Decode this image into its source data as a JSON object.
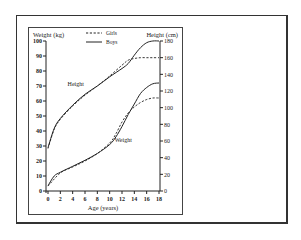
{
  "chart_data": {
    "type": "line",
    "title": "",
    "xlabel": "Age (years)",
    "ylabel": "Weight (kg)",
    "ylabel_right": "Height (cm)",
    "xlim": [
      0,
      18
    ],
    "ylim": [
      0,
      100
    ],
    "ylim_right": [
      0,
      180
    ],
    "x_ticks": [
      0,
      2,
      4,
      6,
      8,
      10,
      12,
      14,
      16,
      18
    ],
    "y_ticks": [
      0,
      10,
      20,
      30,
      40,
      50,
      60,
      70,
      80,
      90,
      100
    ],
    "y_ticks_right": [
      0,
      20,
      40,
      60,
      80,
      100,
      120,
      140,
      160,
      180
    ],
    "grid": false,
    "legend": {
      "position": "top-center",
      "entries": [
        {
          "label": "Girls",
          "style": "dashed"
        },
        {
          "label": "Boys",
          "style": "solid"
        }
      ]
    },
    "annotations": [
      {
        "text": "Height",
        "x": 4.5,
        "y_kg": 70
      },
      {
        "text": "Weight",
        "x": 12.2,
        "y_kg": 33
      }
    ],
    "series": [
      {
        "name": "Boys Height",
        "axis": "right",
        "style": "solid",
        "x": [
          0,
          1,
          2,
          4,
          6,
          8,
          10,
          12,
          13,
          14,
          15,
          16,
          17,
          18
        ],
        "values": [
          52,
          75,
          87,
          103,
          116,
          126,
          137,
          147,
          153,
          163,
          172,
          178,
          180,
          180
        ]
      },
      {
        "name": "Girls Height",
        "axis": "right",
        "style": "dashed",
        "x": [
          0,
          1,
          2,
          4,
          6,
          8,
          10,
          12,
          13,
          14,
          15,
          16,
          17,
          18
        ],
        "values": [
          51,
          74,
          86,
          102,
          115,
          126,
          138,
          151,
          157,
          159,
          160,
          160,
          160,
          160
        ]
      },
      {
        "name": "Boys Weight",
        "axis": "left",
        "style": "solid",
        "x": [
          0,
          1,
          2,
          4,
          6,
          8,
          10,
          11,
          12,
          13,
          14,
          15,
          16,
          17,
          18
        ],
        "values": [
          3.5,
          10,
          12.5,
          16.5,
          20.5,
          25,
          31,
          36,
          43,
          51,
          58,
          65,
          69,
          71.5,
          72
        ]
      },
      {
        "name": "Girls Weight",
        "axis": "left",
        "style": "dashed",
        "x": [
          0,
          2,
          4,
          6,
          8,
          10,
          11,
          12,
          13,
          14,
          15,
          16,
          17,
          18
        ],
        "values": [
          3.3,
          12,
          16,
          20,
          25,
          32,
          38,
          46,
          52,
          56,
          59,
          61,
          62,
          62
        ]
      }
    ]
  }
}
